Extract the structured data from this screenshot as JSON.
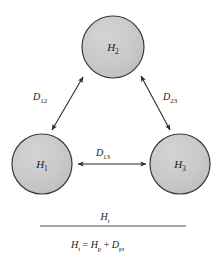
{
  "figure": {
    "type": "diagram",
    "background_color": "#ffffff"
  },
  "style": {
    "circle_fill": "#c9c9c9",
    "circle_stroke": "#3a3a3a",
    "arrow_color": "#2b2b2b",
    "rule_color": "#8a8a8a",
    "text_color": "#1a1a1a"
  },
  "nodes": [
    {
      "id": "h2",
      "name": "hill-2",
      "base": "H",
      "subscript": "2",
      "cx": 113,
      "cy": 47,
      "r": 31
    },
    {
      "id": "h1",
      "name": "hill-1",
      "base": "H",
      "subscript": "1",
      "cx": 42,
      "cy": 164,
      "r": 30
    },
    {
      "id": "h3",
      "name": "hill-3",
      "base": "H",
      "subscript": "3",
      "cx": 180,
      "cy": 164,
      "r": 30
    }
  ],
  "connectors": [
    {
      "id": "d12",
      "name": "distance-h1-h2",
      "base": "D",
      "subscript": "12",
      "from": "h1",
      "to": "h2",
      "x1": 52,
      "y1": 130,
      "x2": 83,
      "y2": 77,
      "label_x": 33,
      "label_y": 100,
      "double_headed": true
    },
    {
      "id": "d23",
      "name": "distance-h2-h3",
      "base": "D",
      "subscript": "23",
      "from": "h2",
      "to": "h3",
      "x1": 170,
      "y1": 130,
      "x2": 141,
      "y2": 76,
      "label_x": 163,
      "label_y": 100,
      "double_headed": true
    },
    {
      "id": "d13",
      "name": "distance-h1-h3",
      "base": "D",
      "subscript": "13",
      "from": "h1",
      "to": "h3",
      "x1": 78,
      "y1": 164,
      "x2": 146,
      "y2": 164,
      "label_x": 103,
      "label_y": 156,
      "double_headed": true
    }
  ],
  "bracket": {
    "name": "total-height-bracket",
    "rule": {
      "x1": 40,
      "x2": 186,
      "y": 226
    },
    "top_label": {
      "name": "total-height-label",
      "base": "H",
      "subscript": "t",
      "x": 105,
      "y": 220
    },
    "equation": {
      "name": "total-height-equation",
      "x": 71,
      "y": 248,
      "text": "Ht = Hp + Dpt",
      "terms": [
        {
          "base": "H",
          "subscript": "t"
        },
        {
          "operator": "="
        },
        {
          "base": "H",
          "subscript": "p"
        },
        {
          "operator": "+"
        },
        {
          "base": "D",
          "subscript": "pt"
        }
      ]
    }
  }
}
